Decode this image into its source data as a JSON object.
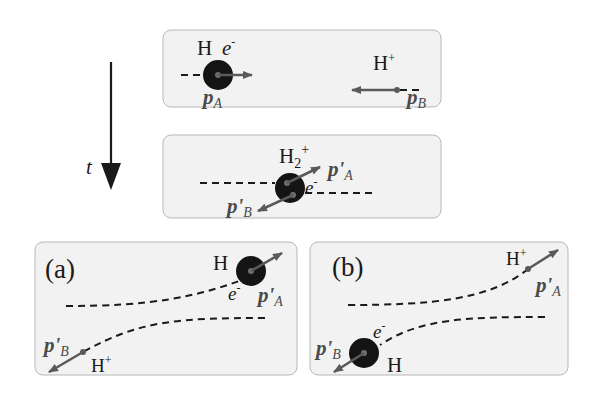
{
  "figure": {
    "time_axis": {
      "label": "t"
    },
    "panels": [
      {
        "id": "initial",
        "labels": {
          "atom": "H",
          "electron": "e",
          "electron_charge": "-",
          "ion": "H",
          "ion_charge": "+",
          "momentum_a": "p",
          "momentum_a_sub": "A",
          "momentum_b": "p",
          "momentum_b_sub": "B"
        }
      },
      {
        "id": "molecular-ion",
        "labels": {
          "molecule": "H",
          "molecule_sub": "2",
          "molecule_charge": "+",
          "electron": "e",
          "electron_charge": "-",
          "momentum_a": "p'",
          "momentum_a_sub": "A",
          "momentum_b": "p'",
          "momentum_b_sub": "B"
        }
      },
      {
        "id": "outcome-a",
        "tag": "(a)",
        "labels": {
          "atom": "H",
          "electron": "e",
          "electron_charge": "-",
          "ion": "H",
          "ion_charge": "+",
          "momentum_a": "p'",
          "momentum_a_sub": "A",
          "momentum_b": "p'",
          "momentum_b_sub": "B"
        }
      },
      {
        "id": "outcome-b",
        "tag": "(b)",
        "labels": {
          "atom": "H",
          "electron": "e",
          "electron_charge": "-",
          "ion": "H",
          "ion_charge": "+",
          "momentum_a": "p'",
          "momentum_a_sub": "A",
          "momentum_b": "p'",
          "momentum_b_sub": "B"
        }
      }
    ],
    "colors": {
      "panel_fill": "#f2f2f2",
      "panel_border": "#b8b8b8",
      "atom": "#141414",
      "vector": "#5a5a5a"
    }
  }
}
